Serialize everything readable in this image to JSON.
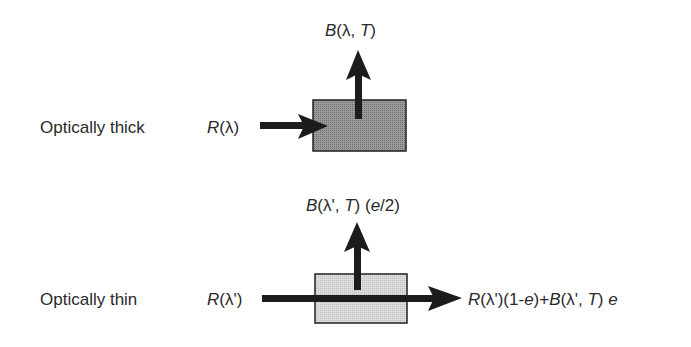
{
  "colors": {
    "background": "#ffffff",
    "text": "#2a2a2a",
    "arrow": "#1c1c1c",
    "thick_box_fill": "#8a8a8a",
    "thin_box_fill": "#d4d4d4",
    "box_stroke": "#222222"
  },
  "thick": {
    "label": "Optically thick",
    "input": {
      "sym": "R",
      "arg": "(λ)"
    },
    "output": {
      "sym": "B",
      "open": "(λ, ",
      "T": "T",
      "close": ")"
    }
  },
  "thin": {
    "label": "Optically thin",
    "input": {
      "sym": "R",
      "arg": "(λ')"
    },
    "output_up": {
      "sym": "B",
      "open": "(λ', ",
      "T": "T",
      "mid": ") (",
      "e": "e",
      "tail": "/2)"
    },
    "output_right": {
      "r_sym": "R",
      "r_arg": "(λ')(1-",
      "e1": "e",
      "plus": ")+",
      "b_sym": "B",
      "b_open": "(λ', ",
      "T": "T",
      "b_close": ") ",
      "e2": "e"
    }
  }
}
